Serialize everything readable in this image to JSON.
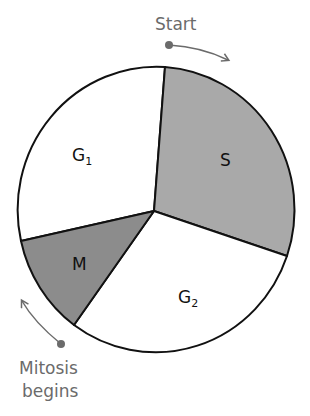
{
  "diagram": {
    "type": "cell-cycle-pie",
    "center": [
      154,
      211
    ],
    "colors": {
      "S": "#a9a9a9",
      "M": "#8c8c8c",
      "G1": "#ffffff",
      "G2": "#ffffff",
      "outline": "#111111",
      "annotation": "#6b6b6b"
    },
    "phases": [
      {
        "id": "G1",
        "label_main": "G",
        "label_sub": "1"
      },
      {
        "id": "S",
        "label_main": "S",
        "label_sub": ""
      },
      {
        "id": "G2",
        "label_main": "G",
        "label_sub": "2"
      },
      {
        "id": "M",
        "label_main": "M",
        "label_sub": ""
      }
    ],
    "annotations": {
      "start": "Start",
      "mitosis_line1": "Mitosis",
      "mitosis_line2": "begins"
    }
  }
}
